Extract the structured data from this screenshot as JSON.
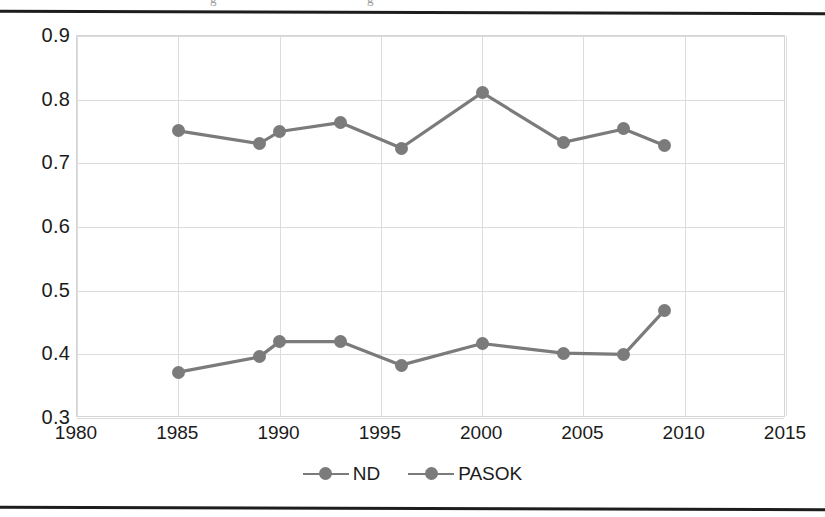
{
  "page": {
    "ghost_caption_fragments": [
      "g",
      "g"
    ]
  },
  "legend": {
    "position": "bottom-center",
    "items": [
      {
        "label": "ND",
        "color": "#7b7b7b",
        "marker": "circle"
      },
      {
        "label": "PASOK",
        "color": "#7b7b7b",
        "marker": "circle"
      }
    ]
  },
  "axes": {
    "y_ticks": [
      "0.9",
      "0.8",
      "0.7",
      "0.6",
      "0.5",
      "0.4",
      "0.3"
    ],
    "x_ticks": [
      "1980",
      "1985",
      "1990",
      "1995",
      "2000",
      "2005",
      "2010",
      "2015"
    ]
  },
  "chart_data": {
    "type": "line",
    "title": "",
    "subtitle": "",
    "xlabel": "",
    "ylabel": "",
    "xlim": [
      1980,
      2015
    ],
    "ylim": [
      0.3,
      0.9
    ],
    "ytick_values": [
      0.9,
      0.8,
      0.7,
      0.6,
      0.5,
      0.4,
      0.3
    ],
    "xtick_values": [
      1980,
      1985,
      1990,
      1995,
      2000,
      2005,
      2010,
      2015
    ],
    "grid": true,
    "legend_position": "bottom-center",
    "colors": {
      "nd": "#7b7b7b",
      "pasok": "#7b7b7b",
      "grid": "#dcdcdc",
      "axis": "#d6d6d6"
    },
    "series": [
      {
        "name": "ND",
        "color": "#7b7b7b",
        "x": [
          1985,
          1989,
          1990,
          1993,
          1996,
          2000,
          2004,
          2007,
          2009
        ],
        "values": [
          0.751,
          0.731,
          0.75,
          0.764,
          0.724,
          0.811,
          0.733,
          0.754,
          0.728
        ]
      },
      {
        "name": "PASOK",
        "color": "#7b7b7b",
        "x": [
          1985,
          1989,
          1990,
          1993,
          1996,
          2000,
          2004,
          2007,
          2009
        ],
        "values": [
          0.372,
          0.396,
          0.42,
          0.42,
          0.383,
          0.417,
          0.402,
          0.4,
          0.469
        ]
      }
    ],
    "annotations": []
  }
}
